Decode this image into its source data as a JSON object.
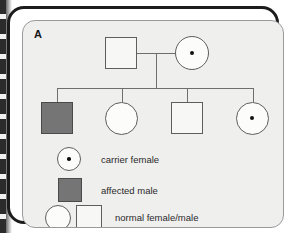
{
  "figure": {
    "panel_label": "A",
    "type": "pedigree-chart",
    "background_color": "#efefee",
    "frame_color": "#1c1c1c",
    "line_color": "#6e6e6e"
  },
  "colors": {
    "affected_fill": "#757575",
    "unaffected_fill": "#f7f7f6",
    "symbol_outline": "#5e5e5e",
    "carrier_dot": "#111111",
    "text": "#2a2a2a"
  },
  "pedigree": {
    "generations": [
      {
        "id": "generation-1",
        "individuals": [
          {
            "id": "I-1",
            "shape": "square",
            "sex": "male",
            "status": "normal",
            "carrier": false,
            "label": "normal-male"
          },
          {
            "id": "I-2",
            "shape": "circle",
            "sex": "female",
            "status": "normal",
            "carrier": true,
            "label": "carrier-female"
          }
        ]
      },
      {
        "id": "generation-2",
        "individuals": [
          {
            "id": "II-1",
            "shape": "square",
            "sex": "male",
            "status": "affected",
            "carrier": false,
            "label": "affected-male"
          },
          {
            "id": "II-2",
            "shape": "circle",
            "sex": "female",
            "status": "normal",
            "carrier": false,
            "label": "normal-female"
          },
          {
            "id": "II-3",
            "shape": "square",
            "sex": "male",
            "status": "normal",
            "carrier": false,
            "label": "normal-male"
          },
          {
            "id": "II-4",
            "shape": "circle",
            "sex": "female",
            "status": "normal",
            "carrier": true,
            "label": "carrier-female"
          }
        ]
      }
    ]
  },
  "legend": {
    "items": [
      {
        "key": "carrier-female",
        "symbol": "circle-with-dot",
        "text": "carrier female"
      },
      {
        "key": "affected-male",
        "symbol": "filled-square",
        "text": "affected male"
      },
      {
        "key": "normal-female-male",
        "symbol": "open-circle-and-open-square",
        "text": "normal female/male"
      }
    ]
  }
}
